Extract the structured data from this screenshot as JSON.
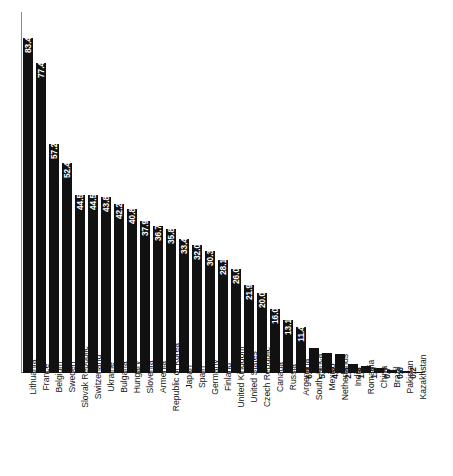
{
  "chart_data": {
    "type": "bar",
    "title": "",
    "subtitle": "",
    "xlabel": "",
    "ylabel": "",
    "ylim": [
      0,
      90
    ],
    "grid": false,
    "legend": null,
    "orientation": "vertical",
    "value_label_position": "inside-top",
    "categories": [
      "Lithuania",
      "France",
      "Belgium",
      "Sweden",
      "Slovak Republic",
      "Switzerland",
      "Ukraine",
      "Bulgaria",
      "Hungary",
      "Slovenia",
      "Armenia",
      "Republic of Korea",
      "Japan",
      "Spain",
      "Germany",
      "Finland",
      "United Kingdom",
      "United States",
      "Czech Republic",
      "Canada",
      "Russia",
      "Argentina",
      "South Africa",
      "Mexico",
      "Netherlands",
      "India",
      "Romania",
      "China",
      "Brazil",
      "Pakistan",
      "Kazakhstan"
    ],
    "values": [
      83.4,
      77.4,
      57.2,
      52.4,
      44.5,
      44.5,
      43.8,
      42.2,
      40.8,
      37.9,
      36.7,
      35.8,
      33.4,
      32.0,
      30.3,
      28.1,
      26.0,
      21.9,
      20.0,
      16.0,
      13.1,
      11.4,
      6.3,
      5.1,
      4.8,
      2.2,
      1.8,
      1.3,
      0.7,
      0.6,
      0.2
    ],
    "value_labels": [
      "83.4",
      "77.4",
      "57.2",
      "52.4",
      "44.5",
      "44.5",
      "43.8",
      "42.2",
      "40.8",
      "37.9",
      "36.7",
      "35.8",
      "33.4",
      "32.0",
      "30.3",
      "28.1",
      "26.0",
      "21.9",
      "20.0",
      "16.0",
      "13.1",
      "11.4",
      "6.3",
      "5.1",
      "4.8",
      "2.2",
      "1.8",
      "1.3",
      "0.7",
      "0.6",
      "0.2"
    ],
    "bar_color": "#111111",
    "axis_color": "#6f6f6f",
    "background_color": "#ffffff"
  }
}
